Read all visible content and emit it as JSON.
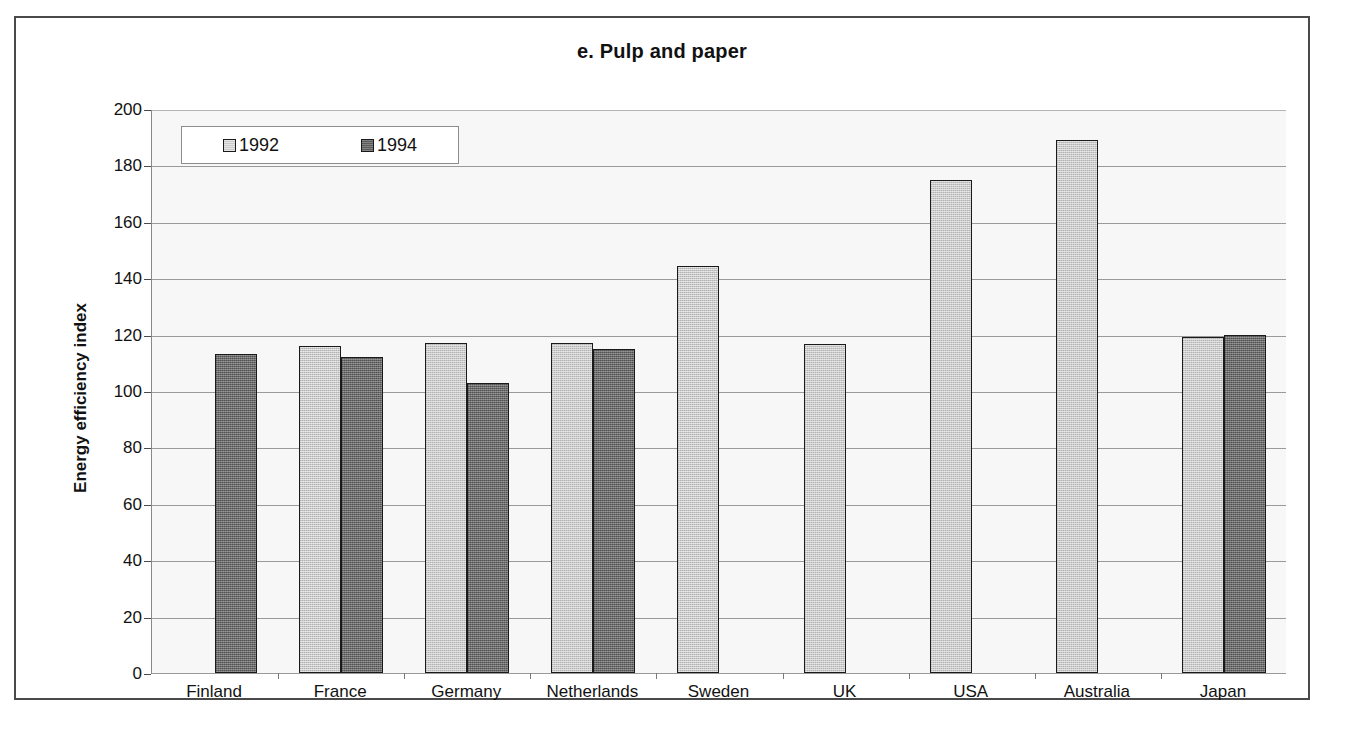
{
  "chart_data": {
    "type": "bar",
    "title": "e. Pulp and paper",
    "xlabel": "",
    "ylabel": "Energy efficiency index",
    "ylim": [
      0,
      200
    ],
    "ytick_step": 20,
    "yticks": [
      200,
      180,
      160,
      140,
      120,
      100,
      80,
      60,
      40,
      20,
      0
    ],
    "grid": true,
    "legend_position": "top-left",
    "categories": [
      "Finland",
      "France",
      "Germany",
      "Netherlands",
      "Sweden",
      "UK",
      "USA",
      "Australia",
      "Japan"
    ],
    "series": [
      {
        "name": "1992",
        "color": "#c9c9c9",
        "values": [
          null,
          116,
          117,
          117,
          144.5,
          116.5,
          175,
          189,
          119
        ]
      },
      {
        "name": "1994",
        "color": "#6c6c6c",
        "values": [
          113,
          112,
          103,
          115,
          null,
          null,
          null,
          null,
          120
        ]
      }
    ]
  },
  "legend": {
    "items": [
      {
        "label": "1992",
        "swatch": "light-gray-swatch"
      },
      {
        "label": "1994",
        "swatch": "dark-gray-swatch"
      }
    ]
  }
}
